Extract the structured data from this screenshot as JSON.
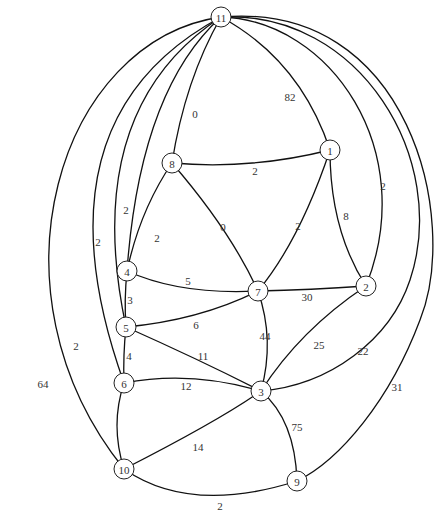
{
  "diagram": {
    "type": "weighted-undirected-graph",
    "nodes": [
      {
        "id": "11",
        "label": "11",
        "x": 221,
        "y": 17
      },
      {
        "id": "1",
        "label": "1",
        "x": 330,
        "y": 150
      },
      {
        "id": "8",
        "label": "8",
        "x": 172,
        "y": 163
      },
      {
        "id": "4",
        "label": "4",
        "x": 127,
        "y": 271
      },
      {
        "id": "7",
        "label": "7",
        "x": 258,
        "y": 291
      },
      {
        "id": "2",
        "label": "2",
        "x": 366,
        "y": 286
      },
      {
        "id": "5",
        "label": "5",
        "x": 126,
        "y": 327
      },
      {
        "id": "6",
        "label": "6",
        "x": 124,
        "y": 383
      },
      {
        "id": "3",
        "label": "3",
        "x": 261,
        "y": 391
      },
      {
        "id": "10",
        "label": "10",
        "x": 124,
        "y": 469
      },
      {
        "id": "9",
        "label": "9",
        "x": 297,
        "y": 481
      }
    ],
    "edges": [
      {
        "from": "11",
        "to": "1",
        "weight": "82",
        "path": "M221,17 Q300,60 330,150",
        "lx": 290,
        "ly": 97
      },
      {
        "from": "11",
        "to": "8",
        "weight": "0",
        "path": "M221,17 Q185,80 172,163",
        "lx": 195,
        "ly": 114
      },
      {
        "from": "11",
        "to": "4",
        "weight": "2",
        "path": "M221,17 Q140,90 127,271",
        "lx": 126,
        "ly": 210
      },
      {
        "from": "11",
        "to": "5",
        "weight": "2",
        "path": "M221,17 Q80,110 126,327",
        "lx": 98,
        "ly": 242
      },
      {
        "from": "11",
        "to": "6",
        "weight": "2",
        "path": "M221,17 Q30,120 124,383",
        "lx": 76,
        "ly": 346
      },
      {
        "from": "11",
        "to": "10",
        "weight": "64",
        "path": "M221,17 C60,40 -20,290 124,469",
        "lx": 43,
        "ly": 384
      },
      {
        "from": "11",
        "to": "2",
        "weight": "2",
        "path": "M221,17 C330,20 420,150 366,286",
        "lx": 383,
        "ly": 186
      },
      {
        "from": "11",
        "to": "3",
        "weight": "22",
        "path": "M221,17 C360,10 450,160 410,280 C390,340 330,385 261,391",
        "lx": 363,
        "ly": 351
      },
      {
        "from": "11",
        "to": "9",
        "weight": "31",
        "path": "M221,17 C410,0 460,220 420,320 C390,400 340,460 297,481",
        "lx": 397,
        "ly": 387
      },
      {
        "from": "8",
        "to": "1",
        "weight": "2",
        "path": "M172,163 Q250,170 330,150",
        "lx": 255,
        "ly": 171
      },
      {
        "from": "8",
        "to": "7",
        "weight": "0",
        "path": "M172,163 Q230,230 258,291",
        "lx": 223,
        "ly": 227
      },
      {
        "from": "8",
        "to": "4",
        "weight": "2",
        "path": "M172,163 Q140,210 127,271",
        "lx": 157,
        "ly": 238
      },
      {
        "from": "1",
        "to": "7",
        "weight": "2",
        "path": "M330,150 Q300,240 258,291",
        "lx": 298,
        "ly": 226
      },
      {
        "from": "1",
        "to": "2",
        "weight": "8",
        "path": "M330,150 Q330,230 366,286",
        "lx": 346,
        "ly": 216
      },
      {
        "from": "4",
        "to": "7",
        "weight": "5",
        "path": "M127,271 Q180,295 258,291",
        "lx": 188,
        "ly": 281
      },
      {
        "from": "4",
        "to": "5",
        "weight": "3",
        "path": "M127,271 Q124,300 126,327",
        "lx": 130,
        "ly": 300
      },
      {
        "from": "7",
        "to": "2",
        "weight": "30",
        "path": "M258,291 Q310,290 366,286",
        "lx": 307,
        "ly": 297
      },
      {
        "from": "7",
        "to": "5",
        "weight": "6",
        "path": "M258,291 Q200,320 126,327",
        "lx": 196,
        "ly": 325
      },
      {
        "from": "7",
        "to": "3",
        "weight": "44",
        "path": "M258,291 Q275,340 261,391",
        "lx": 265,
        "ly": 336
      },
      {
        "from": "5",
        "to": "3",
        "weight": "11",
        "path": "M126,327 Q200,360 261,391",
        "lx": 203,
        "ly": 356
      },
      {
        "from": "5",
        "to": "6",
        "weight": "4",
        "path": "M126,327 Q123,355 124,383",
        "lx": 129,
        "ly": 356
      },
      {
        "from": "6",
        "to": "3",
        "weight": "12",
        "path": "M124,383 Q190,370 261,391",
        "lx": 186,
        "ly": 386
      },
      {
        "from": "6",
        "to": "10",
        "weight": "",
        "path": "M124,383 Q110,425 124,469",
        "lx": 0,
        "ly": 0
      },
      {
        "from": "2",
        "to": "3",
        "weight": "25",
        "path": "M366,286 Q300,330 261,391",
        "lx": 319,
        "ly": 345
      },
      {
        "from": "3",
        "to": "10",
        "weight": "14",
        "path": "M261,391 Q220,420 124,469",
        "lx": 198,
        "ly": 447
      },
      {
        "from": "3",
        "to": "9",
        "weight": "75",
        "path": "M261,391 Q295,420 297,481",
        "lx": 297,
        "ly": 427
      },
      {
        "from": "10",
        "to": "9",
        "weight": "2",
        "path": "M124,469 Q190,515 297,481",
        "lx": 220,
        "ly": 506
      }
    ]
  }
}
